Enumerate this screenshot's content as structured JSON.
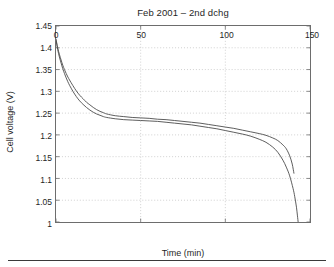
{
  "figure": {
    "title": "Feb 2001 – 2nd dchg",
    "bottom_rule": "",
    "colors": {
      "axis": "#6d6d6d",
      "grid": "#bdbdbd",
      "curve": "#4a4a4a",
      "text": "#1f1f1f",
      "background": "#ffffff"
    }
  },
  "chart_data": {
    "type": "line",
    "title": "Feb 2001 – 2nd dchg",
    "xlabel": "Time (min)",
    "ylabel": "Cell voltage (V)",
    "xlim": [
      0,
      150
    ],
    "ylim": [
      1,
      1.45
    ],
    "xticks": [
      0,
      50,
      100,
      150
    ],
    "xtick_labels": [
      "0",
      "50",
      "100",
      "150"
    ],
    "yticks": [
      1,
      1.05,
      1.1,
      1.15,
      1.2,
      1.25,
      1.3,
      1.35,
      1.4,
      1.45
    ],
    "ytick_labels": [
      "1",
      "1.05",
      "1.1",
      "1.15",
      "1.2",
      "1.25",
      "1.3",
      "1.35",
      "1.4",
      "1.45"
    ],
    "grid": true,
    "grid_style": "dotted",
    "legend": null,
    "legend_position": "none",
    "series": [
      {
        "name": "cell-1",
        "color": "#4a4a4a",
        "x": [
          0,
          1,
          2,
          3,
          4,
          5,
          6,
          7,
          8,
          10,
          12,
          14,
          16,
          18,
          20,
          22,
          24,
          26,
          28,
          30,
          35,
          40,
          45,
          50,
          55,
          60,
          65,
          70,
          75,
          80,
          85,
          90,
          95,
          100,
          105,
          110,
          115,
          120,
          124,
          128,
          131,
          134,
          136,
          138,
          140,
          141,
          142,
          142.6,
          143
        ],
        "y": [
          1.418,
          1.396,
          1.379,
          1.365,
          1.352,
          1.341,
          1.331,
          1.322,
          1.314,
          1.3,
          1.288,
          1.278,
          1.27,
          1.263,
          1.257,
          1.252,
          1.248,
          1.245,
          1.242,
          1.24,
          1.237,
          1.235,
          1.234,
          1.233,
          1.232,
          1.231,
          1.229,
          1.227,
          1.225,
          1.223,
          1.22,
          1.217,
          1.214,
          1.21,
          1.206,
          1.202,
          1.197,
          1.19,
          1.183,
          1.172,
          1.16,
          1.142,
          1.126,
          1.106,
          1.077,
          1.058,
          1.034,
          1.014,
          1.0
        ]
      },
      {
        "name": "cell-2",
        "color": "#4a4a4a",
        "x": [
          0,
          1,
          2,
          3,
          4,
          5,
          6,
          7,
          8,
          10,
          12,
          14,
          16,
          18,
          20,
          22,
          24,
          26,
          28,
          30,
          35,
          40,
          45,
          50,
          55,
          60,
          65,
          70,
          75,
          80,
          85,
          90,
          95,
          100,
          105,
          110,
          115,
          120,
          124,
          128,
          131,
          134,
          136,
          138,
          139.5,
          140.5
        ],
        "y": [
          1.42,
          1.4,
          1.385,
          1.372,
          1.36,
          1.35,
          1.341,
          1.333,
          1.326,
          1.313,
          1.301,
          1.291,
          1.283,
          1.275,
          1.269,
          1.263,
          1.258,
          1.254,
          1.251,
          1.248,
          1.244,
          1.242,
          1.24,
          1.239,
          1.238,
          1.236,
          1.235,
          1.233,
          1.231,
          1.229,
          1.227,
          1.224,
          1.221,
          1.218,
          1.215,
          1.211,
          1.207,
          1.203,
          1.199,
          1.193,
          1.187,
          1.177,
          1.168,
          1.152,
          1.133,
          1.112
        ]
      }
    ]
  }
}
